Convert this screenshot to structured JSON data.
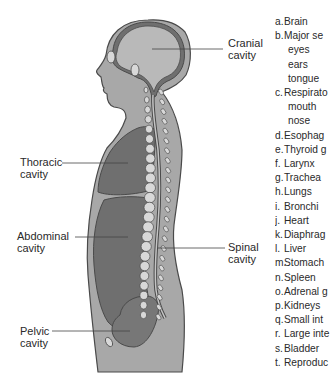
{
  "figure": {
    "colors": {
      "body_fill": "#a8a8a8",
      "cavity_fill": "#6f6f6f",
      "cranial_fill": "#b9b9b9",
      "outline": "#4a4a4a",
      "bone_fill": "#d8d8d8",
      "label_line": "#444444"
    }
  },
  "cavity_labels": {
    "cranial": [
      "Cranial",
      "cavity"
    ],
    "thoracic": [
      "Thoracic",
      "cavity"
    ],
    "abdominal": [
      "Abdominal",
      "cavity"
    ],
    "spinal": [
      "Spinal",
      "cavity"
    ],
    "pelvic": [
      "Pelvic",
      "cavity"
    ]
  },
  "legend": {
    "items": [
      {
        "letter": "a.",
        "text": "Brain",
        "sub": []
      },
      {
        "letter": "b.",
        "text": "Major se",
        "sub": [
          "eyes",
          "ears",
          "tongue"
        ]
      },
      {
        "letter": "c.",
        "text": "Respirato",
        "sub": [
          "mouth",
          "nose"
        ]
      },
      {
        "letter": "d.",
        "text": "Esophag",
        "sub": []
      },
      {
        "letter": "e.",
        "text": "Thyroid g",
        "sub": []
      },
      {
        "letter": "f.",
        "text": "Larynx",
        "sub": []
      },
      {
        "letter": "g.",
        "text": "Trachea",
        "sub": []
      },
      {
        "letter": "h.",
        "text": "Lungs",
        "sub": []
      },
      {
        "letter": "i.",
        "text": "Bronchi",
        "sub": []
      },
      {
        "letter": "j.",
        "text": "Heart",
        "sub": []
      },
      {
        "letter": "k.",
        "text": "Diaphrag",
        "sub": []
      },
      {
        "letter": "l.",
        "text": "Liver",
        "sub": []
      },
      {
        "letter": "m.",
        "text": "Stomach",
        "sub": []
      },
      {
        "letter": "n.",
        "text": "Spleen",
        "sub": []
      },
      {
        "letter": "o.",
        "text": "Adrenal g",
        "sub": []
      },
      {
        "letter": "p.",
        "text": "Kidneys",
        "sub": []
      },
      {
        "letter": "q.",
        "text": "Small int",
        "sub": []
      },
      {
        "letter": "r.",
        "text": "Large inte",
        "sub": []
      },
      {
        "letter": "s.",
        "text": "Bladder",
        "sub": []
      },
      {
        "letter": "t.",
        "text": "Reproduc",
        "sub": []
      }
    ]
  }
}
